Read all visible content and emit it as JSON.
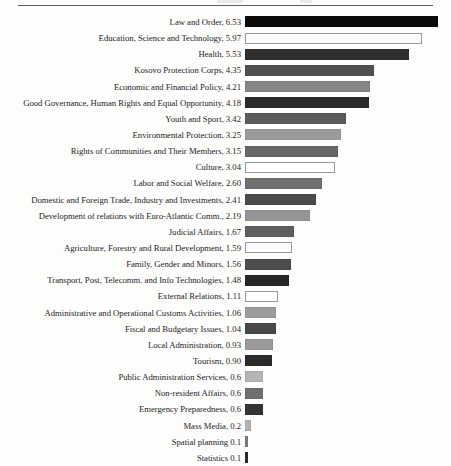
{
  "document": {
    "has_top_rule": true,
    "page_background": "#fdfdfc"
  },
  "chart_data": {
    "type": "bar",
    "orientation": "horizontal",
    "title": "",
    "subtitle": "",
    "xlabel": "",
    "ylabel": "",
    "grid": false,
    "legend": "none",
    "axis_visible": false,
    "value_labels_position": "in-category-label",
    "xlim": [
      0,
      6.53
    ],
    "px_per_unit": 29.6,
    "categories": [
      "Law and Order",
      "Education, Science and Technology",
      "Health",
      "Kosovo Protection Corps",
      "Economic and Financial Policy",
      "Good Governance, Human Rights and Equal Opportunity",
      "Youth and Sport",
      "Environmental Protection",
      "Rights of Communities and Their Members",
      "Culture",
      "Labor and Social Welfare",
      "Domestic and Foreign Trade, Industry and Investments",
      "Development of relations with Euro-Atlantic Comm.",
      "Judicial Affairs",
      "Agriculture, Forestry and Rural Development",
      "Family, Gender and Minors",
      "Transport, Post, Telecomm. and Info Technologies",
      "External Relations",
      "Administrative and Operational Customs Activities",
      "Fiscal and Budgetary Issues",
      "Local Administration",
      "Tourism",
      "Public Administration Services",
      "Non-resident Affairs",
      "Emergency Preparedness",
      "Mass Media",
      "Spatial planning",
      "Statistics"
    ],
    "values": [
      6.53,
      5.97,
      5.53,
      4.35,
      4.21,
      4.18,
      3.42,
      3.25,
      3.15,
      3.04,
      2.6,
      2.41,
      2.19,
      1.67,
      1.59,
      1.56,
      1.48,
      1.11,
      1.06,
      1.04,
      0.93,
      0.9,
      0.6,
      0.6,
      0.6,
      0.2,
      0.1,
      0.1
    ],
    "value_text": [
      "6.53",
      "5.97",
      "5.53",
      "4.35",
      "4.21",
      "4.18",
      "3.42",
      "3.25",
      "3.15",
      "3.04",
      "2.60",
      "2.41",
      "2.19",
      "1.67",
      "1.59",
      "1.56",
      "1.48",
      "1.11",
      "1.06",
      "1.04",
      "0.93",
      "0.90",
      "0.6",
      "0.6",
      "0.6",
      "0.2",
      "0.1",
      "0.1"
    ],
    "bar_colors": [
      "#0b0b0b",
      "#fbfbfb",
      "#2f2f2f",
      "#4f4f4f",
      "#868686",
      "#2a2a2a",
      "#5b5b5b",
      "#9b9b9b",
      "#666666",
      "#ffffff",
      "#707070",
      "#4a4a4a",
      "#959595",
      "#5e5e5e",
      "#fdfdfd",
      "#4d4d4d",
      "#262626",
      "#ffffff",
      "#9b9b9b",
      "#484848",
      "#9a9a9a",
      "#2b2b2b",
      "#b4b4b4",
      "#6f6f6f",
      "#343434",
      "#b2b2b2",
      "#7c7c7c",
      "#2c2c2c"
    ],
    "rows": [
      {
        "label": "Law and Order, 6.53",
        "category": "Law and Order",
        "value": 6.53,
        "color": "#0b0b0b",
        "outlined": false
      },
      {
        "label": "Education, Science and Technology, 5.97",
        "category": "Education, Science and Technology",
        "value": 5.97,
        "color": "#fbfbfb",
        "outlined": true
      },
      {
        "label": "Health, 5.53",
        "category": "Health",
        "value": 5.53,
        "color": "#2f2f2f",
        "outlined": false
      },
      {
        "label": "Kosovo Protection Corps, 4.35",
        "category": "Kosovo Protection Corps",
        "value": 4.35,
        "color": "#4f4f4f",
        "outlined": false
      },
      {
        "label": "Economic and Financial Policy, 4.21",
        "category": "Economic and Financial Policy",
        "value": 4.21,
        "color": "#868686",
        "outlined": false
      },
      {
        "label": "Good Governance, Human Rights and Equal Opportunity, 4.18",
        "category": "Good Governance, Human Rights and Equal Opportunity",
        "value": 4.18,
        "color": "#2a2a2a",
        "outlined": false
      },
      {
        "label": "Youth and Sport, 3.42",
        "category": "Youth and Sport",
        "value": 3.42,
        "color": "#5b5b5b",
        "outlined": false
      },
      {
        "label": "Environmental Protection, 3.25",
        "category": "Environmental Protection",
        "value": 3.25,
        "color": "#9b9b9b",
        "outlined": false
      },
      {
        "label": "Rights of Communities and Their Members, 3.15",
        "category": "Rights of Communities and Their Members",
        "value": 3.15,
        "color": "#666666",
        "outlined": false
      },
      {
        "label": "Culture, 3.04",
        "category": "Culture",
        "value": 3.04,
        "color": "#ffffff",
        "outlined": true
      },
      {
        "label": "Labor and Social Welfare, 2.60",
        "category": "Labor and Social Welfare",
        "value": 2.6,
        "color": "#707070",
        "outlined": false
      },
      {
        "label": "Domestic and Foreign Trade, Industry and Investments, 2.41",
        "category": "Domestic and Foreign Trade, Industry and Investments",
        "value": 2.41,
        "color": "#4a4a4a",
        "outlined": false
      },
      {
        "label": "Development of relations with Euro-Atlantic Comm., 2.19",
        "category": "Development of relations with Euro-Atlantic Comm.",
        "value": 2.19,
        "color": "#959595",
        "outlined": false
      },
      {
        "label": "Judicial Affairs, 1.67",
        "category": "Judicial Affairs",
        "value": 1.67,
        "color": "#5e5e5e",
        "outlined": false
      },
      {
        "label": "Agriculture, Forestry and Rural Development, 1.59",
        "category": "Agriculture, Forestry and Rural Development",
        "value": 1.59,
        "color": "#fdfdfd",
        "outlined": true
      },
      {
        "label": "Family, Gender and Minors, 1.56",
        "category": "Family, Gender and Minors",
        "value": 1.56,
        "color": "#4d4d4d",
        "outlined": false
      },
      {
        "label": "Transport, Post, Telecomm. and Info Technologies, 1.48",
        "category": "Transport, Post, Telecomm. and Info Technologies",
        "value": 1.48,
        "color": "#262626",
        "outlined": false
      },
      {
        "label": "External Relations, 1.11",
        "category": "External Relations",
        "value": 1.11,
        "color": "#ffffff",
        "outlined": true
      },
      {
        "label": "Administrative and Operational Customs Activities, 1.06",
        "category": "Administrative and Operational Customs Activities",
        "value": 1.06,
        "color": "#9b9b9b",
        "outlined": false
      },
      {
        "label": "Fiscal and Budgetary Issues, 1.04",
        "category": "Fiscal and Budgetary Issues",
        "value": 1.04,
        "color": "#484848",
        "outlined": false
      },
      {
        "label": "Local Administration, 0.93",
        "category": "Local Administration",
        "value": 0.93,
        "color": "#9a9a9a",
        "outlined": false
      },
      {
        "label": "Tourism, 0.90",
        "category": "Tourism",
        "value": 0.9,
        "color": "#2b2b2b",
        "outlined": false
      },
      {
        "label": "Public Administration Services, 0.6",
        "category": "Public Administration Services",
        "value": 0.6,
        "color": "#b4b4b4",
        "outlined": false
      },
      {
        "label": "Non-resident Affairs, 0.6",
        "category": "Non-resident Affairs",
        "value": 0.6,
        "color": "#6f6f6f",
        "outlined": false
      },
      {
        "label": "Emergency Preparedness, 0.6",
        "category": "Emergency Preparedness",
        "value": 0.6,
        "color": "#343434",
        "outlined": false
      },
      {
        "label": "Mass Media, 0.2",
        "category": "Mass Media",
        "value": 0.2,
        "color": "#b2b2b2",
        "outlined": false
      },
      {
        "label": "Spatial planning 0.1",
        "category": "Spatial planning",
        "value": 0.1,
        "color": "#7c7c7c",
        "outlined": false
      },
      {
        "label": "Statistics 0.1",
        "category": "Statistics",
        "value": 0.1,
        "color": "#2c2c2c",
        "outlined": false
      }
    ]
  }
}
